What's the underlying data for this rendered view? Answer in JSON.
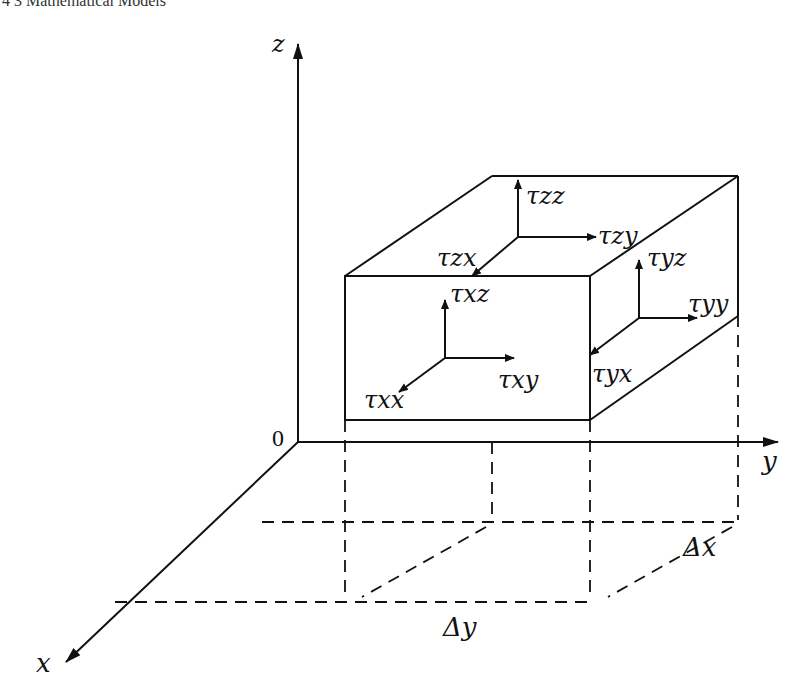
{
  "header": {
    "text": "4   3 Mathematical Models"
  },
  "axes": {
    "x": "x",
    "y": "y",
    "z": "z",
    "origin": "0"
  },
  "stresses": {
    "zz": "τzz",
    "zy": "τzy",
    "zx": "τzx",
    "yz": "τyz",
    "yy": "τyy",
    "yx": "τyx",
    "xz": "τxz",
    "xy": "τxy",
    "xx": "τxx"
  },
  "dimensions": {
    "dx": "Δx",
    "dy": "Δy"
  }
}
